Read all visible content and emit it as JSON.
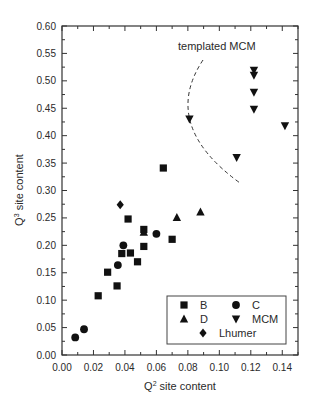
{
  "chart_data": {
    "type": "scatter",
    "title": "",
    "xlabel": "Q2 site content",
    "xlabel_base": "Q",
    "xlabel_sup": "2",
    "xlabel_rest": " site content",
    "ylabel": "Q3 site content",
    "ylabel_base": "Q",
    "ylabel_sup": "3",
    "ylabel_rest": " site content",
    "xlim": [
      0,
      0.15
    ],
    "ylim": [
      0,
      0.6
    ],
    "xticks": [
      "0.00",
      "0.02",
      "0.04",
      "0.06",
      "0.08",
      "0.10",
      "0.12",
      "0.14"
    ],
    "yticks": [
      "0.00",
      "0.05",
      "0.10",
      "0.15",
      "0.20",
      "0.25",
      "0.30",
      "0.35",
      "0.40",
      "0.45",
      "0.50",
      "0.55",
      "0.60"
    ],
    "grid": false,
    "legend_position": "lower right",
    "annotation": "templated MCM",
    "series": [
      {
        "name": "B",
        "marker": "square",
        "points": [
          [
            0.023,
            0.108
          ],
          [
            0.029,
            0.151
          ],
          [
            0.035,
            0.126
          ],
          [
            0.038,
            0.185
          ],
          [
            0.042,
            0.248
          ],
          [
            0.0435,
            0.186
          ],
          [
            0.048,
            0.17
          ],
          [
            0.052,
            0.229
          ],
          [
            0.052,
            0.198
          ],
          [
            0.0644,
            0.341
          ],
          [
            0.07,
            0.211
          ]
        ]
      },
      {
        "name": "C",
        "marker": "circle",
        "points": [
          [
            0.0084,
            0.032
          ],
          [
            0.014,
            0.047
          ],
          [
            0.0355,
            0.164
          ],
          [
            0.039,
            0.2
          ],
          [
            0.06,
            0.221
          ]
        ]
      },
      {
        "name": "D",
        "marker": "triangle-up",
        "points": [
          [
            0.052,
            0.224
          ],
          [
            0.073,
            0.251
          ],
          [
            0.088,
            0.261
          ]
        ]
      },
      {
        "name": "MCM",
        "marker": "triangle-down",
        "points": [
          [
            0.081,
            0.43
          ],
          [
            0.111,
            0.36
          ],
          [
            0.122,
            0.519
          ],
          [
            0.122,
            0.51
          ],
          [
            0.122,
            0.479
          ],
          [
            0.122,
            0.448
          ],
          [
            0.1417,
            0.418
          ]
        ]
      },
      {
        "name": "Lhumer",
        "marker": "diamond",
        "points": [
          [
            0.037,
            0.274
          ]
        ]
      }
    ]
  },
  "legend": {
    "items": [
      {
        "label": "B",
        "marker": "square"
      },
      {
        "label": "C",
        "marker": "circle"
      },
      {
        "label": "D",
        "marker": "triangle-up"
      },
      {
        "label": "MCM",
        "marker": "triangle-down"
      },
      {
        "label": "Lhumer",
        "marker": "diamond"
      }
    ]
  },
  "colors": {
    "ink": "#111111",
    "axis": "#333333",
    "text": "#2a2a2a"
  }
}
